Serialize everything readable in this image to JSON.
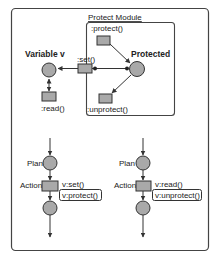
{
  "colors": {
    "stroke": "#333333",
    "fill_node": "#a9a9a9",
    "frame": "#444444",
    "background": "#ffffff"
  },
  "module": {
    "title": "Protect Module"
  },
  "top": {
    "variable_label": "Variable v",
    "protected_label": "Protected",
    "set_label": ":set()",
    "protect_label": ":protect()",
    "unprotect_label": ":unprotect()",
    "read_label": ":read()"
  },
  "flows": [
    {
      "plan_label": "Plan",
      "action_label": "Action",
      "call_primary": "v:set()",
      "call_boxed": "v:protect()"
    },
    {
      "plan_label": "Plan",
      "action_label": "Action",
      "call_primary": "v:read()",
      "call_boxed": "v:unprotect()"
    }
  ]
}
